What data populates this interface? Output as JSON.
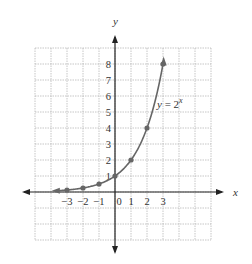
{
  "chart_data": {
    "type": "line",
    "title": "",
    "xlabel": "x",
    "ylabel": "y",
    "series": [
      {
        "name": "y = 2^x",
        "x": [
          -3,
          -2,
          -1,
          0,
          1,
          2,
          3
        ],
        "values": [
          0.125,
          0.25,
          0.5,
          1,
          2,
          4,
          8
        ]
      }
    ],
    "x_ticks": [
      "-3",
      "-2",
      "-1",
      "0",
      "1",
      "2",
      "3"
    ],
    "y_ticks": [
      "1",
      "2",
      "3",
      "4",
      "5",
      "6",
      "7",
      "8"
    ],
    "xlim": [
      -5,
      6
    ],
    "ylim": [
      -3,
      9
    ],
    "grid": true,
    "annotation": "y = 2^x"
  },
  "labels": {
    "x_axis": "x",
    "y_axis": "y",
    "equation_main": "y = 2",
    "equation_exp": "x"
  },
  "colors": {
    "curve": "#666666",
    "axis": "#222222",
    "grid": "#b8b8b8"
  }
}
